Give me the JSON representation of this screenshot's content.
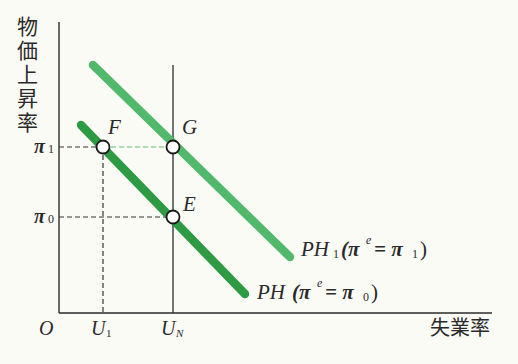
{
  "diagram": {
    "type": "phillips-curve",
    "y_axis_label_chars": [
      "物",
      "価",
      "上",
      "昇",
      "率"
    ],
    "x_axis_label": "失業率",
    "origin_label": "O",
    "x_ticks": [
      {
        "main": "U",
        "sub": "1"
      },
      {
        "main": "U",
        "sub": "N"
      }
    ],
    "y_ticks": [
      {
        "main": "π",
        "sub": "1"
      },
      {
        "main": "π",
        "sub": "0"
      }
    ],
    "points": [
      {
        "label": "F",
        "desc": "PH at π1, U1"
      },
      {
        "label": "G",
        "desc": "PH1 at π1, UN"
      },
      {
        "label": "E",
        "desc": "PH at π0, UN"
      }
    ],
    "curves": [
      {
        "name": "PH",
        "label_main": "PH",
        "label_paren_open": "(π",
        "label_sup": "e",
        "label_eq": "= π",
        "label_sub": "0",
        "label_close": ")",
        "color": "#2e9a44"
      },
      {
        "name": "PH1",
        "label_main": "PH",
        "label_sub_main": "1",
        "label_paren_open": "(π",
        "label_sup": "e",
        "label_eq": "= π",
        "label_sub": "1",
        "label_close": ")",
        "color": "#52b86c"
      }
    ],
    "colors": {
      "axis": "#2a2a2a",
      "dash_black": "#333333",
      "dash_green": "#5cbf73",
      "background": "#fbfbf6"
    }
  }
}
